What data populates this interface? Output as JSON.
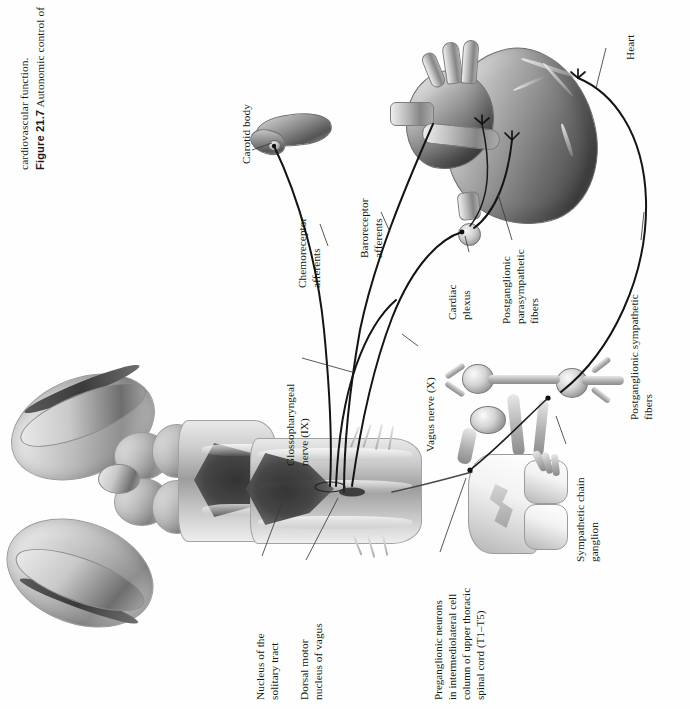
{
  "figure": {
    "number_label": "Figure 21.7",
    "caption_line1": "Autonomic control of",
    "caption_line2": "cardiovascular function.",
    "caption_full": "Figure 21.7  Autonomic control of cardiovascular function.",
    "orientation": "labels and caption rotated 90 degrees counter-clockwise",
    "style": "grayscale airbrushed medical illustration on white background"
  },
  "labels": {
    "heart": "Heart",
    "carotid_body": "Carotid body",
    "chemoreceptor_afferents_l1": "Chemoreceptor",
    "chemoreceptor_afferents_l2": "afferents",
    "baroreceptor_afferents_l1": "Baroreceptor",
    "baroreceptor_afferents_l2": "afferents",
    "cardiac_plexus_l1": "Cardiac",
    "cardiac_plexus_l2": "plexus",
    "postganglionic_parasympathetic_l1": "Postganglionic",
    "postganglionic_parasympathetic_l2": "parasympathetic",
    "postganglionic_parasympathetic_l3": "fibers",
    "postganglionic_sympathetic_l1": "Postganglionic sympathetic",
    "postganglionic_sympathetic_l2": "fibers",
    "glossopharyngeal_l1": "Glossopharyngeal",
    "glossopharyngeal_l2": "nerve (IX)",
    "vagus_nerve": "Vagus nerve (X)",
    "sympathetic_chain_l1": "Sympathetic chain",
    "sympathetic_chain_l2": "ganglion",
    "nucleus_solitary_tract_l1": "Nucleus of the",
    "nucleus_solitary_tract_l2": "solitary tract",
    "dorsal_motor_nucleus_l1": "Dorsal motor",
    "dorsal_motor_nucleus_l2": "nucleus of vagus",
    "preganglionic_neurons_l1": "Preganglionic neurons",
    "preganglionic_neurons_l2": "in intermediolateral cell",
    "preganglionic_neurons_l3": "column of upper thoracic",
    "preganglionic_neurons_l4": "spinal cord (T1–T5)"
  },
  "structures": [
    {
      "name": "brainstem-dorsal-view",
      "description": "Dorsal view of brainstem with cerebellar hemispheres, colliculi and rhomboid fossa of the fourth ventricle"
    },
    {
      "name": "heart",
      "description": "Heart with great vessels and coronary arteries, autonomic nerve terminals on surface"
    },
    {
      "name": "carotid-body",
      "description": "Carotid bifurcation bearing carotid body chemoreceptor"
    },
    {
      "name": "cardiac-plexus",
      "description": "Cardiac plexus ganglion node on vagal pathway"
    },
    {
      "name": "spinal-cord-segment",
      "description": "Upper thoracic spinal cord segment with sympathetic chain ganglia and rami"
    }
  ],
  "colors": {
    "background": "#ffffff",
    "text": "#161616",
    "leader_line": "#3a3a3a",
    "nerve_line": "#141414",
    "tissue_light": "#f2f2f2",
    "tissue_mid": "#9d9d9d",
    "tissue_dark": "#3a3a3a"
  }
}
